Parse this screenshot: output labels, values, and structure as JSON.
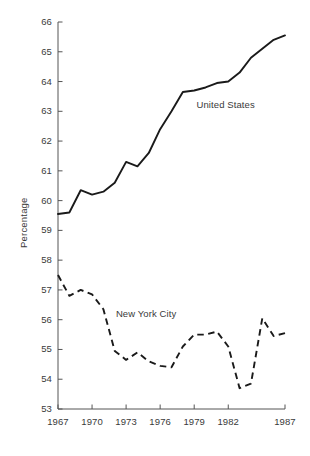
{
  "chart_data": {
    "type": "line",
    "title": "",
    "xlabel": "",
    "ylabel": "Percentage",
    "xlim": [
      1967,
      1987
    ],
    "ylim": [
      53,
      66
    ],
    "grid": false,
    "legend_position": "inline-annotation",
    "y_ticks": [
      66,
      65,
      64,
      63,
      62,
      61,
      60,
      59,
      58,
      57,
      56,
      55,
      54,
      53
    ],
    "x_ticks": [
      1967,
      1970,
      1973,
      1976,
      1979,
      1982,
      1987
    ],
    "x": [
      1967,
      1968,
      1969,
      1970,
      1971,
      1972,
      1973,
      1974,
      1975,
      1976,
      1977,
      1978,
      1979,
      1980,
      1981,
      1982,
      1983,
      1984,
      1985,
      1986,
      1987
    ],
    "series": [
      {
        "name": "United States",
        "style": "solid",
        "color": "#1a1a1a",
        "values": [
          59.55,
          59.6,
          60.35,
          60.2,
          60.3,
          60.6,
          61.3,
          61.15,
          61.6,
          62.4,
          63.0,
          63.65,
          63.7,
          63.8,
          63.95,
          64.0,
          64.3,
          64.8,
          65.1,
          65.4,
          65.55
        ]
      },
      {
        "name": "New York City",
        "style": "dashed",
        "color": "#1a1a1a",
        "values": [
          57.5,
          56.8,
          57.0,
          56.85,
          56.35,
          54.95,
          54.65,
          54.9,
          54.6,
          54.45,
          54.4,
          55.1,
          55.5,
          55.5,
          55.6,
          55.1,
          53.7,
          53.85,
          56.05,
          55.45,
          55.55
        ]
      }
    ],
    "annotations": [
      {
        "text": "United States",
        "x": 1979.2,
        "y": 63.2
      },
      {
        "text": "New York City",
        "x": 1972.1,
        "y": 56.2
      }
    ]
  },
  "axis": {
    "y_title": "Percentage",
    "y_tick_labels": [
      "66",
      "65",
      "64",
      "63",
      "62",
      "61",
      "60",
      "59",
      "58",
      "57",
      "56",
      "55",
      "54",
      "53"
    ],
    "x_tick_labels": [
      "1967",
      "1970",
      "1973",
      "1976",
      "1979",
      "1982",
      "1987"
    ]
  },
  "labels": {
    "series_us": "United States",
    "series_nyc": "New York City"
  },
  "colors": {
    "line": "#1a1a1a",
    "axis": "#555555",
    "text": "#3a3a3a",
    "background": "#ffffff"
  }
}
